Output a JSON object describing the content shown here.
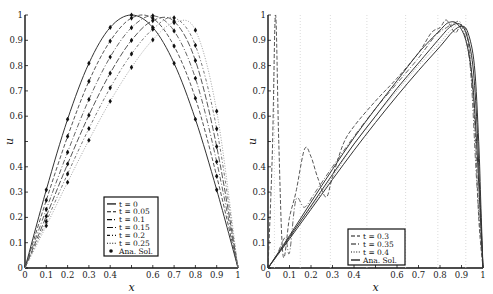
{
  "chart_data": [
    {
      "type": "line",
      "title": "",
      "xlabel": "x",
      "ylabel": "u",
      "xlim": [
        0,
        1
      ],
      "ylim": [
        0,
        1
      ],
      "grid": false,
      "legend_position": "lower center",
      "xticks": [
        "0",
        "0.1",
        "0.2",
        "0.3",
        "0.4",
        "",
        "0.6",
        "0.7",
        "0.8",
        "0.9",
        "1"
      ],
      "yticks": [
        "0",
        "0.1",
        "0.2",
        "0.3",
        "0.4",
        "",
        "0.6",
        "0.7",
        "0.8",
        "0.9",
        "1"
      ],
      "x": [
        0,
        0.1,
        0.2,
        0.3,
        0.4,
        0.5,
        0.6,
        0.7,
        0.8,
        0.9,
        1
      ],
      "series": [
        {
          "name": "t = 0",
          "style": "solid",
          "values": [
            0,
            0.309,
            0.588,
            0.809,
            0.951,
            1.0,
            0.951,
            0.809,
            0.588,
            0.309,
            0
          ]
        },
        {
          "name": "t = 0.05",
          "style": "dashed",
          "values": [
            0,
            0.268,
            0.52,
            0.738,
            0.897,
            0.988,
            0.987,
            0.877,
            0.671,
            0.363,
            0
          ]
        },
        {
          "name": "t = 0.1",
          "style": "dashdot",
          "values": [
            0,
            0.232,
            0.458,
            0.666,
            0.834,
            0.95,
            0.997,
            0.937,
            0.75,
            0.42,
            0
          ]
        },
        {
          "name": "t = 0.15",
          "style": "longdash",
          "values": [
            0,
            0.205,
            0.411,
            0.604,
            0.77,
            0.9,
            0.978,
            0.975,
            0.82,
            0.48,
            0
          ]
        },
        {
          "name": "t = 0.2",
          "style": "dashdot2",
          "values": [
            0,
            0.184,
            0.372,
            0.551,
            0.712,
            0.846,
            0.944,
            0.989,
            0.88,
            0.55,
            0
          ]
        },
        {
          "name": "t = 0.25",
          "style": "dotted",
          "values": [
            0,
            0.167,
            0.339,
            0.505,
            0.659,
            0.793,
            0.902,
            0.97,
            0.94,
            0.62,
            0
          ]
        }
      ],
      "markers": {
        "name": "Ana. Sol.",
        "x": [
          0.1,
          0.2,
          0.3,
          0.4,
          0.5,
          0.6,
          0.7,
          0.8,
          0.9
        ],
        "note": "analytical solution points at each t (same as series values at marker x)"
      },
      "legend": [
        "t = 0",
        "t = 0.05",
        "t = 0.1",
        "t = 0.15",
        "t = 0.2",
        "t = 0.25",
        "Ana. Sol."
      ]
    },
    {
      "type": "line",
      "title": "",
      "xlabel": "x",
      "ylabel": "u",
      "xlim": [
        0,
        1
      ],
      "ylim": [
        0,
        1
      ],
      "grid": "vertical dotted",
      "legend_position": "lower center",
      "xticks": [
        "0",
        "0.1",
        "0.2",
        "0.3",
        "0.4",
        "",
        "0.6",
        "0.7",
        "0.8",
        "0.9",
        "1"
      ],
      "yticks": [
        "0",
        "0.1",
        "0.2",
        "0.3",
        "0.4",
        "",
        "0.6",
        "0.7",
        "0.8",
        "0.9",
        "1"
      ],
      "series": [
        {
          "name": "t = 0.3",
          "style": "dashed",
          "x": [
            0,
            0.02,
            0.035,
            0.05,
            0.07,
            0.1,
            0.13,
            0.17,
            0.2,
            0.23,
            0.27,
            0.3,
            0.35,
            0.4,
            0.5,
            0.6,
            0.7,
            0.76,
            0.8,
            0.83,
            0.87,
            0.9,
            0.93,
            0.96,
            0.98,
            1
          ],
          "values": [
            0,
            0.45,
            1.0,
            0.5,
            0.05,
            0.2,
            0.3,
            0.47,
            0.44,
            0.36,
            0.28,
            0.36,
            0.49,
            0.56,
            0.66,
            0.75,
            0.85,
            0.93,
            0.95,
            0.98,
            0.93,
            0.96,
            0.9,
            0.6,
            0.2,
            0
          ]
        },
        {
          "name": "t = 0.35",
          "style": "dashdot",
          "x": [
            0,
            0.04,
            0.08,
            0.1,
            0.13,
            0.17,
            0.22,
            0.3,
            0.4,
            0.5,
            0.6,
            0.7,
            0.78,
            0.83,
            0.87,
            0.9,
            0.94,
            0.97,
            1
          ],
          "values": [
            0,
            0.05,
            0.12,
            0.06,
            0.27,
            0.24,
            0.3,
            0.4,
            0.52,
            0.63,
            0.73,
            0.83,
            0.92,
            0.95,
            0.97,
            0.96,
            0.8,
            0.35,
            0
          ]
        },
        {
          "name": "t = 0.4",
          "style": "dotted",
          "x": [
            0,
            0.05,
            0.1,
            0.13,
            0.2,
            0.3,
            0.4,
            0.5,
            0.6,
            0.7,
            0.8,
            0.85,
            0.9,
            0.94,
            0.97,
            1
          ],
          "values": [
            0,
            0.06,
            0.12,
            0.16,
            0.24,
            0.36,
            0.49,
            0.6,
            0.7,
            0.8,
            0.89,
            0.94,
            0.96,
            0.85,
            0.4,
            0
          ]
        },
        {
          "name": "Ana. Sol. (t = 0.3)",
          "style": "solid",
          "x": [
            0,
            0.1,
            0.2,
            0.3,
            0.4,
            0.5,
            0.6,
            0.7,
            0.8,
            0.84,
            0.88,
            0.92,
            0.95,
            0.97,
            0.985,
            1
          ],
          "values": [
            0,
            0.128,
            0.26,
            0.39,
            0.515,
            0.63,
            0.74,
            0.85,
            0.94,
            0.97,
            0.965,
            0.9,
            0.75,
            0.5,
            0.25,
            0
          ]
        },
        {
          "name": "Ana. Sol. (t = 0.35)",
          "style": "solid",
          "x": [
            0,
            0.1,
            0.2,
            0.3,
            0.4,
            0.5,
            0.6,
            0.7,
            0.8,
            0.85,
            0.89,
            0.92,
            0.95,
            0.97,
            0.985,
            1
          ],
          "values": [
            0,
            0.122,
            0.245,
            0.37,
            0.49,
            0.6,
            0.71,
            0.81,
            0.91,
            0.955,
            0.965,
            0.93,
            0.82,
            0.6,
            0.3,
            0
          ]
        },
        {
          "name": "Ana. Sol. (t = 0.4)",
          "style": "solid",
          "x": [
            0,
            0.1,
            0.2,
            0.3,
            0.4,
            0.5,
            0.6,
            0.7,
            0.8,
            0.86,
            0.9,
            0.93,
            0.96,
            0.98,
            0.99,
            1
          ],
          "values": [
            0,
            0.115,
            0.232,
            0.35,
            0.465,
            0.575,
            0.68,
            0.78,
            0.875,
            0.935,
            0.955,
            0.93,
            0.8,
            0.5,
            0.25,
            0
          ]
        }
      ],
      "vertical_gridlines_x": [
        0.03,
        0.15,
        0.29,
        0.46,
        0.64,
        0.79,
        0.92
      ],
      "legend": [
        "t = 0.3",
        "t = 0.35",
        "t = 0.4",
        "Ana. Sol."
      ]
    }
  ],
  "left": {
    "xlabel": "x",
    "ylabel": "u",
    "legend": [
      {
        "label": "t = 0",
        "style": "solid"
      },
      {
        "label": "t = 0.05",
        "style": "dashed"
      },
      {
        "label": "t = 0.1",
        "style": "dashdot"
      },
      {
        "label": "t = 0.15",
        "style": "longdash"
      },
      {
        "label": "t = 0.2",
        "style": "dashdot2"
      },
      {
        "label": "t = 0.25",
        "style": "dotted"
      },
      {
        "label": "Ana. Sol.",
        "style": "marker"
      }
    ]
  },
  "right": {
    "xlabel": "x",
    "ylabel": "u",
    "legend": [
      {
        "label": "t = 0.3",
        "style": "dashed"
      },
      {
        "label": "t = 0.35",
        "style": "dashdot"
      },
      {
        "label": "t = 0.4",
        "style": "dotted"
      },
      {
        "label": "Ana. Sol.",
        "style": "solid"
      }
    ]
  }
}
